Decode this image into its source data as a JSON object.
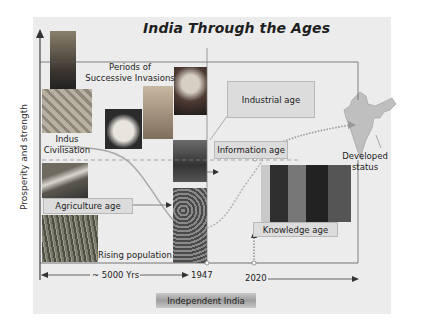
{
  "title": "India Through the Ages",
  "y_axis_label": "Prosperity and strength",
  "labels": {
    "invasions": "Periods of Successive Invasions",
    "indus": "Indus Civilisation",
    "agriculture": "Agriculture age",
    "rising_population": "Rising population",
    "industrial": "Industrial age",
    "information": "Information age",
    "knowledge": "Knowledge age",
    "developed": "Developed status"
  },
  "timeline": {
    "span": "~ 5000 Yrs",
    "year_independence": "1947",
    "year_target": "2020"
  },
  "banner": "Independent India",
  "images": [
    "statue-photo",
    "indus-ruins-photo",
    "alexander-bust-photo",
    "mughal-portrait-photo",
    "british-portrait-photo",
    "freedom-struggle-photo",
    "river-field-photo",
    "wheat-crop-photo",
    "crowd-photo",
    "computer-user-photo",
    "india-map"
  ],
  "colors": {
    "panel_bg": "#ececec",
    "box_bg": "#dcdcdc",
    "curve": "#a0a0a0",
    "dotted_curve": "#9a9a9a",
    "axis": "#444444"
  }
}
